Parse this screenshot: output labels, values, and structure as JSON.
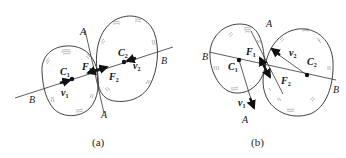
{
  "figure": {
    "type": "two-body contact (collision) diagram",
    "panels": [
      {
        "id": "a",
        "caption": "(a)",
        "labels": {
          "line_a_top": "A",
          "line_a_bottom": "A",
          "line_b_left": "B",
          "line_b_right": "B",
          "c1": "C",
          "c1_sub": "1",
          "c2": "C",
          "c2_sub": "2",
          "f1": "F",
          "f1_sub": "1",
          "f2": "F",
          "f2_sub": "2",
          "v1": "v",
          "v1_sub": "1",
          "v2": "v",
          "v2_sub": "2"
        }
      },
      {
        "id": "b",
        "caption": "(b)",
        "labels": {
          "line_a_top": "A",
          "line_a_bottom": "A",
          "line_b_left": "B",
          "line_b_right": "B",
          "c1": "C",
          "c1_sub": "1",
          "c2": "C",
          "c2_sub": "2",
          "f1": "F",
          "f1_sub": "1",
          "f2": "F",
          "f2_sub": "2",
          "v1": "v",
          "v1_sub": "1",
          "v2": "v",
          "v2_sub": "2"
        }
      }
    ],
    "colors": {
      "stroke": "#2b2b2b",
      "vector": "#111111",
      "background": "#ffffff"
    }
  }
}
